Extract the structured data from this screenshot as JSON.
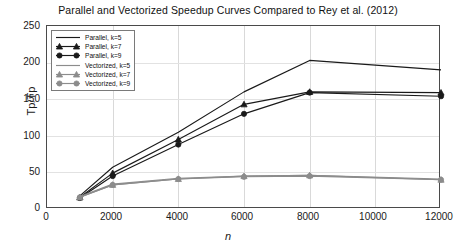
{
  "chart_data": {
    "type": "line",
    "title": "Parallel and Vectorized Speedup Curves Compared to Rey et al. (2012)",
    "xlabel": "n",
    "ylabel": "Tp/Tp",
    "xlim": [
      0,
      12000
    ],
    "ylim": [
      0,
      250
    ],
    "xticks": [
      0,
      2000,
      4000,
      6000,
      8000,
      10000,
      12000
    ],
    "yticks": [
      0,
      50,
      100,
      150,
      200,
      250
    ],
    "grid": true,
    "legend_position": "upper left",
    "x": [
      1000,
      2000,
      4000,
      6000,
      8000,
      12000
    ],
    "series": [
      {
        "name": "Parallel, k=5",
        "marker": "none",
        "color": "#1a1a1a",
        "values": [
          18,
          57,
          105,
          160,
          203,
          190
        ]
      },
      {
        "name": "Parallel, k=7",
        "marker": "triangle",
        "color": "#1a1a1a",
        "values": [
          16,
          49,
          95,
          143,
          160,
          159
        ]
      },
      {
        "name": "Parallel, k=9",
        "marker": "circle",
        "color": "#1a1a1a",
        "values": [
          15,
          45,
          88,
          130,
          159,
          154
        ]
      },
      {
        "name": "Vectorized, k=5",
        "marker": "none",
        "color": "#8c8c8c",
        "values": [
          17,
          34,
          42,
          45,
          46,
          41
        ]
      },
      {
        "name": "Vectorized, k=7",
        "marker": "triangle",
        "color": "#8c8c8c",
        "values": [
          16,
          33,
          41,
          45,
          46,
          40
        ]
      },
      {
        "name": "Vectorized, k=9",
        "marker": "circle",
        "color": "#8c8c8c",
        "values": [
          16,
          33,
          41,
          44,
          45,
          40
        ]
      }
    ]
  },
  "axis": {
    "y_tick_labels": [
      "0",
      "50",
      "100",
      "150",
      "200",
      "250"
    ],
    "x_tick_labels": [
      "0",
      "2000",
      "4000",
      "6000",
      "8000",
      "10000",
      "12000"
    ],
    "y_title": "Tp/Tp",
    "x_title": "n"
  },
  "legend": {
    "items": [
      {
        "label": "Parallel, k=5"
      },
      {
        "label": "Parallel, k=7"
      },
      {
        "label": "Parallel, k=9"
      },
      {
        "label": "Vectorized, k=5"
      },
      {
        "label": "Vectorized, k=7"
      },
      {
        "label": "Vectorized, k=9"
      }
    ]
  },
  "colors": {
    "parallel": "#1a1a1a",
    "vectorized": "#8c8c8c",
    "grid": "#d9d9d9",
    "axis": "#4a4a4a"
  }
}
